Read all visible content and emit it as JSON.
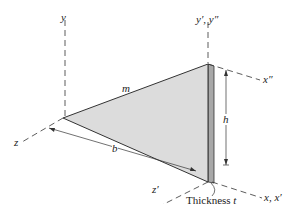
{
  "figure": {
    "colors": {
      "plate_face": "#d9d9d9",
      "plate_edge": "#9a9a9a",
      "lines": "#333333",
      "background": "#ffffff"
    }
  },
  "labels": {
    "y_axis": "y",
    "y_prime_axis": "y′, y″",
    "x_double_prime_axis": "x″",
    "x_axis": "x, x′",
    "z_axis": "z",
    "z_prime_axis": "z′",
    "mass": "m",
    "height": "h",
    "base": "b",
    "thickness_word": "Thickness",
    "thickness_symbol": "t"
  }
}
